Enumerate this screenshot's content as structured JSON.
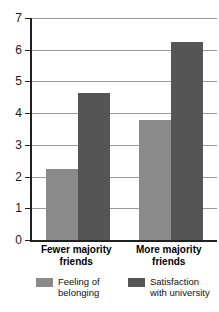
{
  "chart_data": {
    "type": "bar",
    "title": "",
    "subtitle": "",
    "xlabel": "",
    "ylabel": "",
    "ylim": [
      0,
      7
    ],
    "yticks": [
      "0",
      "1",
      "2",
      "3",
      "4",
      "5",
      "6",
      "7"
    ],
    "grid": true,
    "legend_position": "bottom",
    "categories": [
      "Fewer majority\nfriends",
      "More majority\nfriends"
    ],
    "category_labels_flat": [
      "Fewer majority friends",
      "More majority friends"
    ],
    "series": [
      {
        "name": "Feeling of\nbelonging",
        "name_flat": "Feeling of belonging",
        "color": "#8a8a8a",
        "values": [
          2.25,
          3.8
        ]
      },
      {
        "name": "Satisfaction\nwith university",
        "name_flat": "Satisfaction with university",
        "color": "#555555",
        "values": [
          4.65,
          6.25
        ]
      }
    ]
  },
  "colors": {
    "light_bar": "#8a8a8a",
    "dark_bar": "#555555",
    "axis": "#202020",
    "gridline": "#9a9a9a",
    "background": "#ffffff"
  }
}
